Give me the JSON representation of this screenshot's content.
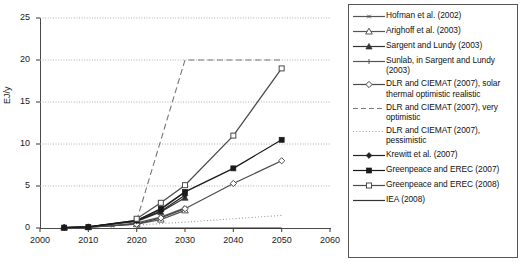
{
  "chart_data": {
    "type": "line",
    "title": "",
    "xlabel": "",
    "ylabel": "EJ/y",
    "xlim": [
      2000,
      2060
    ],
    "ylim": [
      0,
      25
    ],
    "xticks": [
      2000,
      2010,
      2020,
      2030,
      2040,
      2050,
      2060
    ],
    "yticks": [
      0,
      5,
      10,
      15,
      20,
      25
    ],
    "grid": "horizontal-dotted",
    "legend_position": "right-outside",
    "series": [
      {
        "name": "Hofman et al. (2002)",
        "marker": "asterisk",
        "line": "solid",
        "color": "#555555",
        "x": [
          2005,
          2010,
          2015,
          2020,
          2025,
          2030
        ],
        "y": [
          0.05,
          0.1,
          0.25,
          0.6,
          1.3,
          2.4
        ]
      },
      {
        "name": "Arighoff et al. (2003)",
        "marker": "open-triangle",
        "line": "solid",
        "color": "#555555",
        "x": [
          2005,
          2010,
          2020,
          2025,
          2030
        ],
        "y": [
          0.05,
          0.1,
          0.45,
          1.0,
          2.1
        ]
      },
      {
        "name": "Sargent and Lundy (2003)",
        "marker": "filled-triangle",
        "line": "solid",
        "color": "#333333",
        "x": [
          2005,
          2010,
          2020,
          2025,
          2030
        ],
        "y": [
          0.05,
          0.12,
          0.8,
          1.9,
          3.6
        ]
      },
      {
        "name": "Sunlab, in Sargent and Lundy (2003)",
        "marker": "plus",
        "line": "solid",
        "color": "#555555",
        "x": [
          2005,
          2010,
          2020,
          2025,
          2030
        ],
        "y": [
          0.05,
          0.12,
          0.9,
          2.2,
          4.3
        ]
      },
      {
        "name": "DLR and CIEMAT (2007), solar thermal optimistic realistic",
        "marker": "open-diamond",
        "line": "solid",
        "color": "#4a4a4a",
        "x": [
          2010,
          2020,
          2025,
          2030,
          2040,
          2050
        ],
        "y": [
          0.1,
          0.45,
          1.2,
          2.3,
          5.3,
          8.0
        ]
      },
      {
        "name": "DLR and CIEMAT (2007), very optimistic",
        "marker": "none",
        "line": "dashed",
        "color": "#777777",
        "x": [
          2020,
          2030,
          2040,
          2050
        ],
        "y": [
          0.9,
          20.0,
          20.0,
          20.0
        ]
      },
      {
        "name": "DLR and CIEMAT (2007), pessimistic",
        "marker": "none",
        "line": "dotted",
        "color": "#999999",
        "x": [
          2020,
          2030,
          2040,
          2050
        ],
        "y": [
          0.35,
          0.7,
          1.1,
          1.5
        ]
      },
      {
        "name": "Krewitt et al. (2007)",
        "marker": "filled-diamond",
        "line": "solid",
        "color": "#222222",
        "x": [
          2005,
          2010,
          2020,
          2025,
          2030
        ],
        "y": [
          0.05,
          0.12,
          0.85,
          2.0,
          3.9
        ]
      },
      {
        "name": "Greenpeace and EREC (2007)",
        "marker": "filled-square",
        "line": "solid",
        "color": "#1a1a1a",
        "x": [
          2005,
          2010,
          2020,
          2025,
          2030,
          2040,
          2050
        ],
        "y": [
          0.05,
          0.12,
          0.9,
          2.3,
          4.3,
          7.1,
          10.5
        ]
      },
      {
        "name": "Greenpeace and EREC (2008)",
        "marker": "open-square",
        "line": "solid",
        "color": "#4a4a4a",
        "x": [
          2020,
          2025,
          2030,
          2040,
          2050
        ],
        "y": [
          1.1,
          3.0,
          5.1,
          11.0,
          19.0
        ]
      },
      {
        "name": "IEA (2008)",
        "marker": "none",
        "line": "solid",
        "color": "#333333",
        "x": [
          2020,
          2030,
          2040,
          2050
        ],
        "y": [
          0.0,
          0.0,
          0.0,
          0.0
        ]
      }
    ]
  },
  "axes": {
    "ylabel": "EJ/y",
    "yticks": [
      "0",
      "5",
      "10",
      "15",
      "20",
      "25"
    ],
    "xticks": [
      "2000",
      "2010",
      "2020",
      "2030",
      "2040",
      "2050",
      "2060"
    ]
  },
  "legend": {
    "items": [
      {
        "label": "Hofman et al. (2002)",
        "key": "asterisk-solid"
      },
      {
        "label": "Arighoff et al. (2003)",
        "key": "open-triangle-solid"
      },
      {
        "label": "Sargent and Lundy (2003)",
        "key": "filled-triangle-solid"
      },
      {
        "label": "Sunlab, in Sargent and Lundy (2003)",
        "key": "plus-solid"
      },
      {
        "label": "DLR and CIEMAT (2007), solar thermal optimistic realistic",
        "key": "open-diamond-solid"
      },
      {
        "label": "DLR and CIEMAT (2007), very optimistic",
        "key": "dashed"
      },
      {
        "label": "DLR and CIEMAT (2007), pessimistic",
        "key": "dotted"
      },
      {
        "label": "Krewitt et al. (2007)",
        "key": "filled-diamond-solid"
      },
      {
        "label": "Greenpeace and EREC (2007)",
        "key": "filled-square-solid"
      },
      {
        "label": "Greenpeace and EREC (2008)",
        "key": "open-square-solid"
      },
      {
        "label": "IEA (2008)",
        "key": "plain-solid"
      }
    ]
  }
}
